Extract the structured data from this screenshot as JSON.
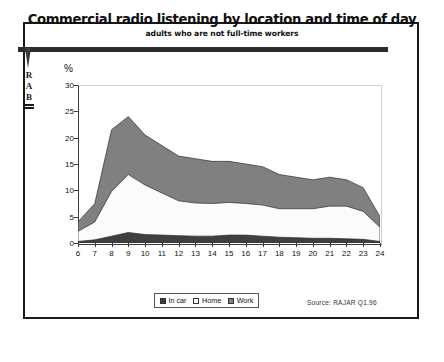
{
  "title": "Commercial radio listening by location and time of day",
  "subtitle": "adults who are not full-time workers",
  "logo": {
    "line1": "R",
    "line2": "A",
    "line3": "B"
  },
  "axis": {
    "y_unit_label": "%"
  },
  "source": "Source:  RAJAR Q1.96",
  "legend": [
    {
      "label": "In car",
      "color": "#3f3f3f"
    },
    {
      "label": "Home",
      "color": "#fbfbfb"
    },
    {
      "label": "Work",
      "color": "#808080"
    }
  ],
  "chart_data": {
    "type": "area",
    "title": "Commercial radio listening by location and time of day",
    "subtitle": "adults who are not full-time workers",
    "xlabel": "",
    "ylabel": "%",
    "stacked": true,
    "grid": false,
    "legend_position": "bottom",
    "xlim": [
      6,
      24
    ],
    "ylim": [
      0,
      30
    ],
    "yticks": [
      0,
      5,
      10,
      15,
      20,
      25,
      30
    ],
    "x": [
      6,
      7,
      8,
      9,
      10,
      11,
      12,
      13,
      14,
      15,
      16,
      17,
      18,
      19,
      20,
      21,
      22,
      23,
      24
    ],
    "xticklabels": [
      "6",
      "7",
      "8",
      "9",
      "10",
      "11",
      "12",
      "13",
      "14",
      "15",
      "16",
      "17",
      "18",
      "19",
      "20",
      "21",
      "22",
      "23",
      "24"
    ],
    "series": [
      {
        "name": "In car",
        "color": "#3f3f3f",
        "values": [
          0.3,
          0.6,
          1.3,
          2.0,
          1.6,
          1.5,
          1.4,
          1.3,
          1.3,
          1.5,
          1.5,
          1.3,
          1.1,
          1.0,
          0.9,
          0.9,
          0.8,
          0.7,
          0.3
        ]
      },
      {
        "name": "Home",
        "color": "#fbfbfb",
        "values": [
          1.9,
          3.4,
          8.5,
          11.0,
          9.4,
          8.0,
          6.6,
          6.3,
          6.2,
          6.2,
          6.0,
          5.9,
          5.4,
          5.5,
          5.6,
          6.1,
          6.2,
          5.3,
          2.7
        ]
      },
      {
        "name": "Work",
        "color": "#808080",
        "values": [
          1.8,
          3.5,
          11.7,
          11.0,
          9.5,
          9.0,
          8.5,
          8.4,
          8.0,
          7.8,
          7.5,
          7.3,
          6.5,
          6.0,
          5.5,
          5.5,
          5.0,
          4.5,
          2.0
        ]
      }
    ],
    "totals": [
      4.0,
      7.5,
      21.5,
      24.0,
      20.5,
      18.5,
      16.5,
      16.0,
      15.5,
      15.5,
      15.0,
      14.5,
      13.0,
      12.5,
      12.0,
      12.5,
      12.0,
      10.5,
      5.0
    ]
  }
}
